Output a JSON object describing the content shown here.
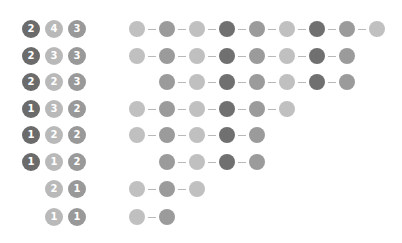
{
  "colors": {
    "dark": "#707070",
    "medium": "#9b9b9b",
    "light": "#c0c0c0",
    "badge_dark": "#6b6b6b",
    "badge_light": "#b9b9b9",
    "badge_medium": "#999999",
    "connector": "#b8b8b8",
    "background": "#ffffff"
  },
  "layout": {
    "row_y": [
      20,
      47,
      73,
      100,
      126,
      153,
      180,
      208
    ],
    "badge_x": [
      22,
      45,
      68
    ],
    "dot_x0": 129,
    "dot_spacing": 30
  },
  "rows": [
    {
      "badges": [
        {
          "col": 0,
          "value": "2",
          "shade": "dark"
        },
        {
          "col": 1,
          "value": "4",
          "shade": "light"
        },
        {
          "col": 2,
          "value": "3",
          "shade": "medium"
        }
      ],
      "dots": [
        {
          "col": 0,
          "shade": "light"
        },
        {
          "col": 1,
          "shade": "medium"
        },
        {
          "col": 2,
          "shade": "light"
        },
        {
          "col": 3,
          "shade": "dark"
        },
        {
          "col": 4,
          "shade": "medium"
        },
        {
          "col": 5,
          "shade": "light"
        },
        {
          "col": 6,
          "shade": "dark"
        },
        {
          "col": 7,
          "shade": "medium"
        },
        {
          "col": 8,
          "shade": "light"
        }
      ]
    },
    {
      "badges": [
        {
          "col": 0,
          "value": "2",
          "shade": "dark"
        },
        {
          "col": 1,
          "value": "3",
          "shade": "light"
        },
        {
          "col": 2,
          "value": "3",
          "shade": "medium"
        }
      ],
      "dots": [
        {
          "col": 0,
          "shade": "light"
        },
        {
          "col": 1,
          "shade": "medium"
        },
        {
          "col": 2,
          "shade": "light"
        },
        {
          "col": 3,
          "shade": "dark"
        },
        {
          "col": 4,
          "shade": "medium"
        },
        {
          "col": 5,
          "shade": "light"
        },
        {
          "col": 6,
          "shade": "dark"
        },
        {
          "col": 7,
          "shade": "medium"
        }
      ]
    },
    {
      "badges": [
        {
          "col": 0,
          "value": "2",
          "shade": "dark"
        },
        {
          "col": 1,
          "value": "2",
          "shade": "light"
        },
        {
          "col": 2,
          "value": "3",
          "shade": "medium"
        }
      ],
      "dots": [
        {
          "col": 1,
          "shade": "medium"
        },
        {
          "col": 2,
          "shade": "light"
        },
        {
          "col": 3,
          "shade": "dark"
        },
        {
          "col": 4,
          "shade": "medium"
        },
        {
          "col": 5,
          "shade": "light"
        },
        {
          "col": 6,
          "shade": "dark"
        },
        {
          "col": 7,
          "shade": "medium"
        }
      ]
    },
    {
      "badges": [
        {
          "col": 0,
          "value": "1",
          "shade": "dark"
        },
        {
          "col": 1,
          "value": "3",
          "shade": "light"
        },
        {
          "col": 2,
          "value": "2",
          "shade": "medium"
        }
      ],
      "dots": [
        {
          "col": 0,
          "shade": "light"
        },
        {
          "col": 1,
          "shade": "medium"
        },
        {
          "col": 2,
          "shade": "light"
        },
        {
          "col": 3,
          "shade": "dark"
        },
        {
          "col": 4,
          "shade": "medium"
        },
        {
          "col": 5,
          "shade": "light"
        }
      ]
    },
    {
      "badges": [
        {
          "col": 0,
          "value": "1",
          "shade": "dark"
        },
        {
          "col": 1,
          "value": "2",
          "shade": "light"
        },
        {
          "col": 2,
          "value": "2",
          "shade": "medium"
        }
      ],
      "dots": [
        {
          "col": 0,
          "shade": "light"
        },
        {
          "col": 1,
          "shade": "medium"
        },
        {
          "col": 2,
          "shade": "light"
        },
        {
          "col": 3,
          "shade": "dark"
        },
        {
          "col": 4,
          "shade": "medium"
        }
      ]
    },
    {
      "badges": [
        {
          "col": 0,
          "value": "1",
          "shade": "dark"
        },
        {
          "col": 1,
          "value": "1",
          "shade": "light"
        },
        {
          "col": 2,
          "value": "2",
          "shade": "medium"
        }
      ],
      "dots": [
        {
          "col": 1,
          "shade": "medium"
        },
        {
          "col": 2,
          "shade": "light"
        },
        {
          "col": 3,
          "shade": "dark"
        },
        {
          "col": 4,
          "shade": "medium"
        }
      ]
    },
    {
      "badges": [
        {
          "col": 1,
          "value": "2",
          "shade": "light"
        },
        {
          "col": 2,
          "value": "1",
          "shade": "medium"
        }
      ],
      "dots": [
        {
          "col": 0,
          "shade": "light"
        },
        {
          "col": 1,
          "shade": "medium"
        },
        {
          "col": 2,
          "shade": "light"
        }
      ]
    },
    {
      "badges": [
        {
          "col": 1,
          "value": "1",
          "shade": "light"
        },
        {
          "col": 2,
          "value": "1",
          "shade": "medium"
        }
      ],
      "dots": [
        {
          "col": 0,
          "shade": "light"
        },
        {
          "col": 1,
          "shade": "medium"
        }
      ]
    }
  ]
}
